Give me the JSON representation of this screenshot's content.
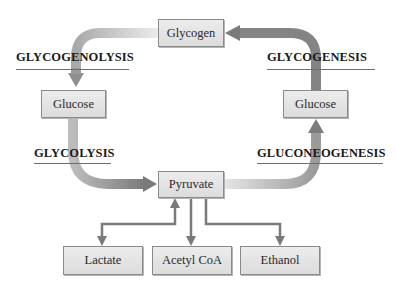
{
  "diagram": {
    "nodes": {
      "glycogen": "Glycogen",
      "glucose_left": "Glucose",
      "glucose_right": "Glucose",
      "pyruvate": "Pyruvate",
      "lactate": "Lactate",
      "acetyl_coa": "Acetyl CoA",
      "ethanol": "Ethanol"
    },
    "processes": {
      "glycogenolysis": "GLYCOGENOLYSIS",
      "glycogenesis": "GLYCOGENESIS",
      "glycolysis": "GLYCOLYSIS",
      "gluconeogenesis": "GLUCONEOGENESIS"
    },
    "edges": [
      {
        "from": "Glycogen",
        "to": "Glucose (left)",
        "via": "GLYCOGENOLYSIS"
      },
      {
        "from": "Glucose (left)",
        "to": "Pyruvate",
        "via": "GLYCOLYSIS"
      },
      {
        "from": "Pyruvate",
        "to": "Glucose (right)",
        "via": "GLUCONEOGENESIS"
      },
      {
        "from": "Glucose (right)",
        "to": "Glycogen",
        "via": "GLYCOGENESIS"
      },
      {
        "from": "Pyruvate",
        "to": "Lactate",
        "bidirectional": true
      },
      {
        "from": "Pyruvate",
        "to": "Acetyl CoA"
      },
      {
        "from": "Pyruvate",
        "to": "Ethanol"
      }
    ],
    "colors": {
      "box_fill": "#e4e4e4",
      "box_border": "#8a8a8a",
      "arrow_dark": "#7a7a7a",
      "arrow_light": "#d8d8d8",
      "text": "#1a1a1a"
    }
  }
}
